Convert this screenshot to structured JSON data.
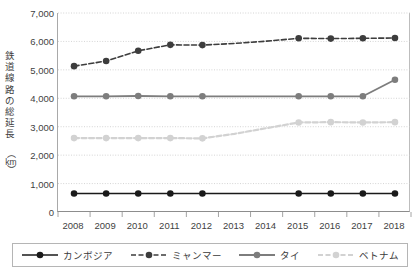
{
  "chart_data": {
    "type": "line",
    "title": "",
    "xlabel": "",
    "ylabel": "鉄道線路の総延長",
    "yunit": "km",
    "ylim": [
      0,
      7000
    ],
    "ytick_step": 1000,
    "grid": true,
    "legend_position": "bottom",
    "categories": [
      "2008",
      "2009",
      "2010",
      "2011",
      "2012",
      "2013",
      "2014",
      "2015",
      "2016",
      "2017",
      "2018"
    ],
    "yticks": [
      "0",
      "1,000",
      "2,000",
      "3,000",
      "4,000",
      "5,000",
      "6,000",
      "7,000"
    ],
    "marker_years": [
      "2008",
      "2009",
      "2010",
      "2011",
      "2012",
      "2015",
      "2016",
      "2017",
      "2018"
    ],
    "series": [
      {
        "name": "カンボジア",
        "color": "#1a1a1a",
        "style": "solid",
        "values": [
          650,
          650,
          650,
          650,
          650,
          650,
          650,
          650,
          650,
          650,
          650
        ]
      },
      {
        "name": "ミャンマー",
        "color": "#3d3d3d",
        "style": "dashed",
        "values": [
          5130,
          5310,
          5670,
          5880,
          5870,
          5930,
          6010,
          6110,
          6100,
          6110,
          6120
        ]
      },
      {
        "name": "タイ",
        "color": "#7d7d7d",
        "style": "solid",
        "values": [
          4070,
          4070,
          4080,
          4070,
          4070,
          4070,
          4070,
          4070,
          4070,
          4070,
          4650
        ]
      },
      {
        "name": "ベトナム",
        "color": "#d2d2d2",
        "style": "dashed",
        "values": [
          2600,
          2600,
          2600,
          2600,
          2590,
          2750,
          2950,
          3150,
          3160,
          3150,
          3160
        ]
      }
    ]
  }
}
